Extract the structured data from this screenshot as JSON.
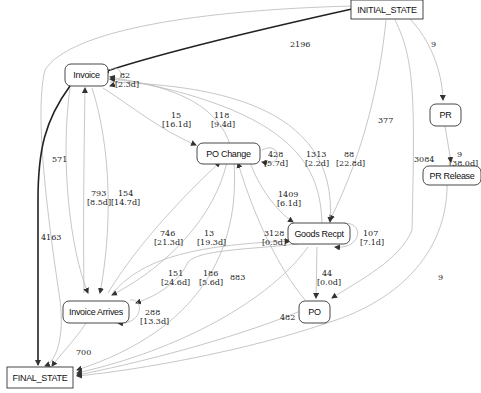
{
  "diagram": {
    "type": "process-flow-graph",
    "nodes": {
      "initial": {
        "id": "INITIAL_STATE",
        "label": "INITIAL_STATE",
        "shape": "rect"
      },
      "final": {
        "id": "FINAL_STATE",
        "label": "FINAL_STATE",
        "shape": "rect"
      },
      "invoice": {
        "id": "Invoice",
        "label": "Invoice",
        "shape": "rounded"
      },
      "po_change": {
        "id": "PO Change",
        "label": "PO Change",
        "shape": "rounded"
      },
      "goods_recpt": {
        "id": "Goods Recpt",
        "label": "Goods Recpt",
        "shape": "rounded"
      },
      "invoice_arrives": {
        "id": "Invoice Arrives",
        "label": "Invoice Arrives",
        "shape": "rounded"
      },
      "po": {
        "id": "PO",
        "label": "PO",
        "shape": "rounded"
      },
      "pr": {
        "id": "PR",
        "label": "PR",
        "shape": "rounded"
      },
      "pr_release": {
        "id": "PR Release",
        "label": "PR Release",
        "shape": "rounded"
      }
    },
    "edges": [
      {
        "from": "INITIAL_STATE",
        "to": "Invoice",
        "count": "2196",
        "duration": ""
      },
      {
        "from": "INITIAL_STATE",
        "to": "PR",
        "count": "9",
        "duration": ""
      },
      {
        "from": "INITIAL_STATE",
        "to": "Goods Recpt",
        "count": "377",
        "duration": ""
      },
      {
        "from": "INITIAL_STATE",
        "to": "PO",
        "count": "3084",
        "duration": ""
      },
      {
        "from": "INITIAL_STATE",
        "to": "FINAL_STATE",
        "count": "571",
        "duration": ""
      },
      {
        "from": "Invoice",
        "to": "Invoice",
        "count": "82",
        "duration": "[2.3d]"
      },
      {
        "from": "Invoice",
        "to": "PO Change",
        "count": "15",
        "duration": "[16.1d]"
      },
      {
        "from": "PO Change",
        "to": "Invoice",
        "count": "118",
        "duration": "[9.4d]"
      },
      {
        "from": "Invoice",
        "to": "FINAL_STATE",
        "count": "4163",
        "duration": ""
      },
      {
        "from": "Invoice Arrives",
        "to": "Invoice",
        "count": "793",
        "duration": "[8.5d]"
      },
      {
        "from": "Invoice",
        "to": "Invoice Arrives",
        "count": "154",
        "duration": "[14.7d]"
      },
      {
        "from": "PO Change",
        "to": "PO Change",
        "count": "428",
        "duration": "[5.7d]"
      },
      {
        "from": "Goods Recpt",
        "to": "Invoice",
        "count": "1313",
        "duration": "[2.2d]"
      },
      {
        "from": "Invoice",
        "to": "Goods Recpt",
        "count": "88",
        "duration": "[22.8d]"
      },
      {
        "from": "PO Change",
        "to": "Goods Recpt",
        "count": "1409",
        "duration": "[6.1d]"
      },
      {
        "from": "Goods Recpt",
        "to": "Goods Recpt",
        "count": "107",
        "duration": "[7.1d]"
      },
      {
        "from": "Invoice Arrives",
        "to": "PO Change",
        "count": "746",
        "duration": "[21.3d]"
      },
      {
        "from": "PO Change",
        "to": "Invoice Arrives",
        "count": "13",
        "duration": "[19.3d]"
      },
      {
        "from": "Invoice Arrives",
        "to": "Goods Recpt",
        "count": "3128",
        "duration": "[0.5d]"
      },
      {
        "from": "Goods Recpt",
        "to": "Invoice Arrives",
        "count": "151",
        "duration": "[24.6d]"
      },
      {
        "from": "PO",
        "to": "PO Change",
        "count": "186",
        "duration": "[5.6d]"
      },
      {
        "from": "PO Change",
        "to": "FINAL_STATE",
        "count": "883",
        "duration": ""
      },
      {
        "from": "Invoice Arrives",
        "to": "Invoice Arrives",
        "count": "288",
        "duration": "[13.3d]"
      },
      {
        "from": "Goods Recpt",
        "to": "PO",
        "count": "44",
        "duration": "[0.0d]"
      },
      {
        "from": "PO",
        "to": "FINAL_STATE",
        "count": "482",
        "duration": ""
      },
      {
        "from": "PR",
        "to": "PR Release",
        "count": "9",
        "duration": "[38.0d]"
      },
      {
        "from": "PR Release",
        "to": "FINAL_STATE",
        "count": "9",
        "duration": ""
      },
      {
        "from": "Invoice Arrives",
        "to": "FINAL_STATE",
        "count": "700",
        "duration": ""
      }
    ],
    "labels": {
      "e_2196": "2196",
      "e_9_top": "9",
      "e_377": "377",
      "e_3084": "3084",
      "e_571": "571",
      "e_82": "82",
      "e_82_d": "[2.3d]",
      "e_15": "15",
      "e_15_d": "[16.1d]",
      "e_118": "118",
      "e_118_d": "[9.4d]",
      "e_4163": "4163",
      "e_793": "793",
      "e_793_d": "[8.5d]",
      "e_154": "154",
      "e_154_d": "[14.7d]",
      "e_428": "428",
      "e_428_d": "[5.7d]",
      "e_1313": "1313",
      "e_1313_d": "[2.2d]",
      "e_88": "88",
      "e_88_d": "[22.8d]",
      "e_1409": "1409",
      "e_1409_d": "[6.1d]",
      "e_107": "107",
      "e_107_d": "[7.1d]",
      "e_746": "746",
      "e_746_d": "[21.3d]",
      "e_13": "13",
      "e_13_d": "[19.3d]",
      "e_3128": "3128",
      "e_3128_d": "[0.5d]",
      "e_151": "151",
      "e_151_d": "[24.6d]",
      "e_186": "186",
      "e_186_d": "[5.6d]",
      "e_883": "883",
      "e_288": "288",
      "e_288_d": "[13.3d]",
      "e_44": "44",
      "e_44_d": "[0.0d]",
      "e_482": "482",
      "e_9_pr": "9",
      "e_9_pr_d": "[38.0d]",
      "e_9_bottom": "9",
      "e_700": "700"
    }
  },
  "colors": {
    "edge": "#b9b9b9",
    "edge_strong": "#222222",
    "node_border": "#333333",
    "background": "#ffffff"
  }
}
